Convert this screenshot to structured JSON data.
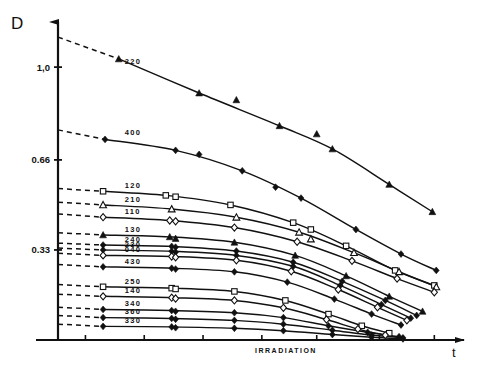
{
  "chart_data": {
    "type": "line",
    "title": "",
    "xlabel": "IRRADIATION",
    "ylabel": "D",
    "xaxis_symbol": "t",
    "grid": false,
    "legend": "inline-labels",
    "ylim": [
      0,
      1.18
    ],
    "xlim": [
      0,
      1.0
    ],
    "ytick_values": [
      1.0,
      0.66,
      0.33
    ],
    "ytick_labels": [
      "1,0",
      "0.66",
      "0.33"
    ],
    "xtick_values": [
      0.07,
      0.22,
      0.37,
      0.52,
      0.66,
      0.82,
      0.96
    ],
    "xtick_labels": [
      "",
      "",
      "",
      "",
      "",
      "",
      ""
    ],
    "series": [
      {
        "name": "220",
        "marker": "filled-triangle",
        "label_x": 0.17,
        "label_y": 1.0,
        "dash_start": [
          0.0,
          1.11
        ],
        "dash_end": [
          0.155,
          1.03
        ],
        "points": [
          [
            0.155,
            1.03
          ],
          [
            0.36,
            0.905
          ],
          [
            0.565,
            0.785
          ],
          [
            0.7,
            0.7
          ],
          [
            0.845,
            0.57
          ],
          [
            0.955,
            0.47
          ]
        ],
        "extra_points": [
          [
            0.455,
            0.88
          ],
          [
            0.66,
            0.755
          ]
        ]
      },
      {
        "name": "400",
        "marker": "filled-diamond",
        "label_x": 0.17,
        "label_y": 0.74,
        "dash_start": [
          0.0,
          0.77
        ],
        "dash_end": [
          0.12,
          0.735
        ],
        "points": [
          [
            0.12,
            0.735
          ],
          [
            0.3,
            0.695
          ],
          [
            0.47,
            0.62
          ],
          [
            0.62,
            0.52
          ],
          [
            0.76,
            0.405
          ],
          [
            0.875,
            0.315
          ],
          [
            0.965,
            0.255
          ]
        ],
        "extra_points": [
          [
            0.36,
            0.68
          ],
          [
            0.555,
            0.56
          ]
        ]
      },
      {
        "name": "120",
        "marker": "open-square",
        "label_x": 0.17,
        "label_y": 0.545,
        "dash_start": [
          0.0,
          0.555
        ],
        "dash_end": [
          0.115,
          0.545
        ],
        "points": [
          [
            0.115,
            0.545
          ],
          [
            0.275,
            0.53
          ],
          [
            0.44,
            0.495
          ],
          [
            0.6,
            0.43
          ],
          [
            0.735,
            0.345
          ],
          [
            0.86,
            0.255
          ],
          [
            0.96,
            0.2
          ]
        ],
        "extra_points": [
          [
            0.3,
            0.525
          ],
          [
            0.645,
            0.405
          ]
        ]
      },
      {
        "name": "210",
        "marker": "open-triangle",
        "label_x": 0.17,
        "label_y": 0.495,
        "dash_start": [
          0.0,
          0.505
        ],
        "dash_end": [
          0.115,
          0.495
        ],
        "points": [
          [
            0.115,
            0.495
          ],
          [
            0.29,
            0.48
          ],
          [
            0.455,
            0.45
          ],
          [
            0.615,
            0.395
          ],
          [
            0.755,
            0.32
          ],
          [
            0.87,
            0.25
          ],
          [
            0.965,
            0.195
          ]
        ],
        "extra_points": [
          [
            0.645,
            0.37
          ]
        ]
      },
      {
        "name": "110",
        "marker": "open-diamond",
        "label_x": 0.17,
        "label_y": 0.45,
        "dash_start": [
          0.0,
          0.462
        ],
        "dash_end": [
          0.115,
          0.45
        ],
        "points": [
          [
            0.115,
            0.45
          ],
          [
            0.285,
            0.438
          ],
          [
            0.45,
            0.412
          ],
          [
            0.61,
            0.36
          ],
          [
            0.75,
            0.29
          ],
          [
            0.865,
            0.225
          ],
          [
            0.96,
            0.175
          ]
        ],
        "extra_points": [
          [
            0.3,
            0.435
          ]
        ]
      },
      {
        "name": "130",
        "marker": "filled-triangle",
        "label_x": 0.17,
        "label_y": 0.385,
        "dash_start": [
          0.0,
          0.393
        ],
        "dash_end": [
          0.115,
          0.385
        ],
        "points": [
          [
            0.115,
            0.385
          ],
          [
            0.285,
            0.378
          ],
          [
            0.45,
            0.358
          ],
          [
            0.605,
            0.31
          ],
          [
            0.735,
            0.235
          ],
          [
            0.845,
            0.16
          ],
          [
            0.93,
            0.105
          ]
        ],
        "extra_points": [
          [
            0.3,
            0.372
          ]
        ]
      },
      {
        "name": "240",
        "marker": "filled-diamond",
        "label_x": 0.17,
        "label_y": 0.348,
        "dash_start": [
          0.0,
          0.355
        ],
        "dash_end": [
          0.115,
          0.348
        ],
        "points": [
          [
            0.115,
            0.348
          ],
          [
            0.29,
            0.343
          ],
          [
            0.455,
            0.326
          ],
          [
            0.6,
            0.285
          ],
          [
            0.725,
            0.215
          ],
          [
            0.835,
            0.145
          ],
          [
            0.915,
            0.09
          ]
        ],
        "extra_points": [
          [
            0.3,
            0.34
          ]
        ]
      },
      {
        "name": "230",
        "marker": "filled-diamond",
        "label_x": 0.17,
        "label_y": 0.33,
        "dash_start": [
          0.0,
          0.337
        ],
        "dash_end": [
          0.115,
          0.33
        ],
        "points": [
          [
            0.115,
            0.33
          ],
          [
            0.29,
            0.325
          ],
          [
            0.455,
            0.31
          ],
          [
            0.6,
            0.27
          ],
          [
            0.72,
            0.2
          ],
          [
            0.825,
            0.13
          ],
          [
            0.9,
            0.08
          ]
        ],
        "extra_points": [
          [
            0.3,
            0.322
          ]
        ]
      },
      {
        "name": "040",
        "marker": "open-diamond",
        "label_x": 0.17,
        "label_y": 0.31,
        "dash_start": [
          0.0,
          0.318
        ],
        "dash_end": [
          0.115,
          0.31
        ],
        "points": [
          [
            0.115,
            0.31
          ],
          [
            0.29,
            0.306
          ],
          [
            0.455,
            0.292
          ],
          [
            0.595,
            0.252
          ],
          [
            0.715,
            0.185
          ],
          [
            0.815,
            0.12
          ],
          [
            0.89,
            0.072
          ]
        ],
        "extra_points": [
          [
            0.3,
            0.303
          ]
        ]
      },
      {
        "name": "430",
        "marker": "filled-diamond",
        "label_x": 0.17,
        "label_y": 0.268,
        "dash_start": [
          0.0,
          0.277
        ],
        "dash_end": [
          0.115,
          0.268
        ],
        "points": [
          [
            0.115,
            0.268
          ],
          [
            0.29,
            0.263
          ],
          [
            0.45,
            0.25
          ],
          [
            0.585,
            0.212
          ],
          [
            0.705,
            0.15
          ],
          [
            0.8,
            0.095
          ],
          [
            0.875,
            0.055
          ]
        ],
        "extra_points": [
          [
            0.3,
            0.26
          ]
        ]
      },
      {
        "name": "250",
        "marker": "open-square",
        "label_x": 0.17,
        "label_y": 0.195,
        "dash_start": [
          0.0,
          0.203
        ],
        "dash_end": [
          0.115,
          0.195
        ],
        "points": [
          [
            0.115,
            0.195
          ],
          [
            0.29,
            0.19
          ],
          [
            0.45,
            0.178
          ],
          [
            0.58,
            0.145
          ],
          [
            0.69,
            0.095
          ],
          [
            0.775,
            0.052
          ],
          [
            0.845,
            0.025
          ]
        ],
        "extra_points": [
          [
            0.3,
            0.187
          ]
        ]
      },
      {
        "name": "140",
        "marker": "open-diamond",
        "label_x": 0.17,
        "label_y": 0.16,
        "dash_start": [
          0.0,
          0.168
        ],
        "dash_end": [
          0.115,
          0.16
        ],
        "points": [
          [
            0.115,
            0.16
          ],
          [
            0.29,
            0.155
          ],
          [
            0.45,
            0.145
          ],
          [
            0.575,
            0.118
          ],
          [
            0.685,
            0.075
          ],
          [
            0.765,
            0.04
          ],
          [
            0.835,
            0.018
          ]
        ],
        "extra_points": [
          [
            0.3,
            0.152
          ]
        ]
      },
      {
        "name": "340",
        "marker": "filled-diamond",
        "label_x": 0.17,
        "label_y": 0.112,
        "dash_start": [
          0.0,
          0.12
        ],
        "dash_end": [
          0.115,
          0.112
        ],
        "points": [
          [
            0.115,
            0.112
          ],
          [
            0.29,
            0.108
          ],
          [
            0.45,
            0.1
          ],
          [
            0.575,
            0.082
          ],
          [
            0.69,
            0.052
          ],
          [
            0.79,
            0.028
          ],
          [
            0.87,
            0.012
          ]
        ],
        "extra_points": [
          [
            0.3,
            0.105
          ]
        ]
      },
      {
        "name": "360",
        "marker": "filled-diamond",
        "label_x": 0.17,
        "label_y": 0.082,
        "dash_start": [
          0.0,
          0.09
        ],
        "dash_end": [
          0.115,
          0.082
        ],
        "points": [
          [
            0.115,
            0.082
          ],
          [
            0.29,
            0.079
          ],
          [
            0.45,
            0.072
          ],
          [
            0.575,
            0.058
          ],
          [
            0.7,
            0.036
          ],
          [
            0.8,
            0.018
          ],
          [
            0.88,
            0.008
          ]
        ],
        "extra_points": [
          [
            0.3,
            0.076
          ]
        ]
      },
      {
        "name": "330",
        "marker": "filled-diamond",
        "label_x": 0.17,
        "label_y": 0.05,
        "dash_start": [
          0.0,
          0.058
        ],
        "dash_end": [
          0.115,
          0.05
        ],
        "points": [
          [
            0.115,
            0.05
          ],
          [
            0.29,
            0.048
          ],
          [
            0.45,
            0.043
          ],
          [
            0.575,
            0.034
          ],
          [
            0.7,
            0.02
          ],
          [
            0.8,
            0.01
          ],
          [
            0.88,
            0.004
          ]
        ],
        "extra_points": [
          [
            0.3,
            0.045
          ]
        ]
      }
    ],
    "colors": {
      "ink": "#111111",
      "background": "#ffffff"
    }
  }
}
